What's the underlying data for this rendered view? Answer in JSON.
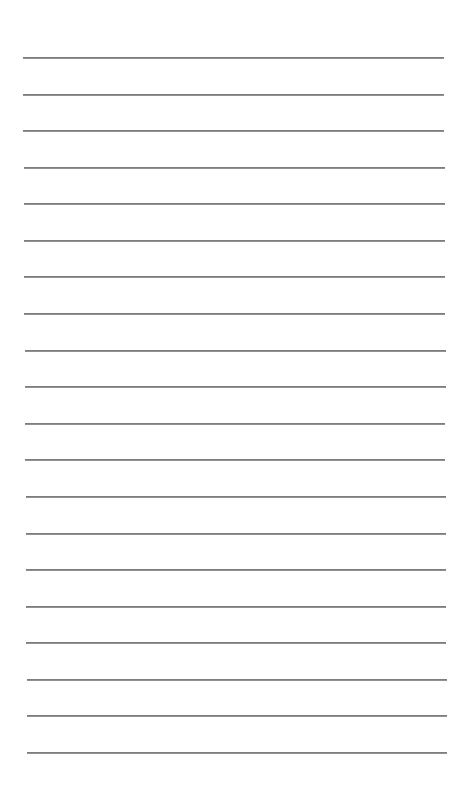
{
  "document": {
    "type": "lined-paper",
    "background_color": "#ffffff",
    "rule_color": "#7d7d7d",
    "rule_count": 20,
    "first_rule_y": 57,
    "rule_spacing": 36.58,
    "rule_left_top": 23,
    "rule_left_bottom": 27,
    "rule_right_top": 444,
    "rule_right_bottom": 447
  }
}
